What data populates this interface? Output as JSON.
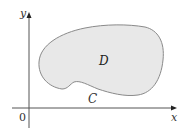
{
  "diagram": {
    "axes": {
      "x_label": "x",
      "y_label": "y",
      "origin_label": "0"
    },
    "region": {
      "label": "D",
      "fill_color": "#e8e8e8"
    },
    "boundary_curve": {
      "label": "C",
      "stroke_color": "#8a8a8a"
    },
    "colors": {
      "axis": "#555555",
      "background": "#ffffff"
    }
  }
}
